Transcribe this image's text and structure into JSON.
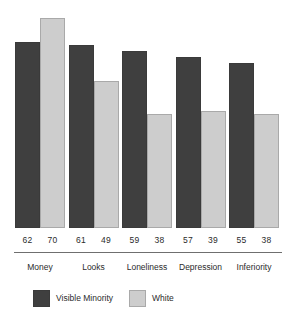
{
  "chart_data": {
    "type": "bar",
    "title": "",
    "subtitle": "",
    "xlabel": "",
    "ylabel": "",
    "grid": false,
    "legend_position": "bottom-left",
    "ylim": [
      0,
      70
    ],
    "categories": [
      "Money",
      "Looks",
      "Loneliness",
      "Depression",
      "Inferiority"
    ],
    "series": [
      {
        "name": "Visible Minority",
        "color": "#3f3f3f",
        "values": [
          62,
          61,
          59,
          57,
          55
        ]
      },
      {
        "name": "White",
        "color": "#cdcdcd",
        "values": [
          70,
          49,
          38,
          39,
          38
        ]
      }
    ],
    "value_labels": [
      [
        "62",
        "70"
      ],
      [
        "61",
        "49"
      ],
      [
        "59",
        "38"
      ],
      [
        "57",
        "39"
      ],
      [
        "55",
        "38"
      ]
    ]
  },
  "colors": {
    "background": "#ffffff",
    "series_visible_minority": "#3f3f3f",
    "series_white": "#cdcdcd",
    "series_white_outline": "#a9a9a9",
    "axis_rule": "#6f6f6f",
    "text": "#2b2b2b"
  }
}
